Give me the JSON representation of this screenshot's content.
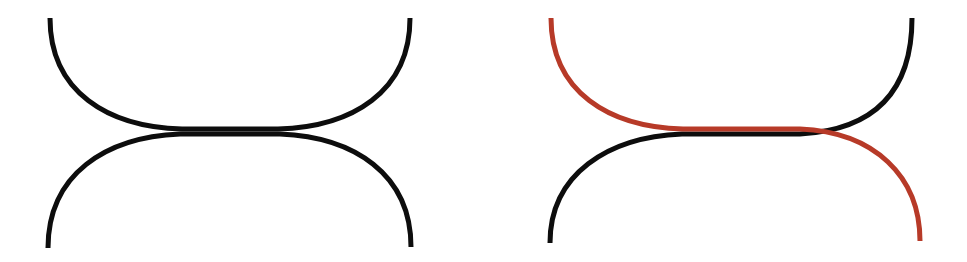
{
  "figure": {
    "kind": "line-diagram",
    "width": 967,
    "height": 262,
    "background_color": "#FFFFFF",
    "stroke_width": 5,
    "panel_count": 2,
    "caption": ""
  },
  "colors": {
    "black": "#0D0D0D",
    "red": "#B73A28",
    "background": "#FFFFFF"
  },
  "chart_data": {
    "type": "line",
    "subtitle": "",
    "xlabel": "",
    "ylabel": "",
    "xlim": [
      0,
      967
    ],
    "ylim": [
      0,
      262
    ],
    "grid": false,
    "legend": "none",
    "axis_visible": false,
    "tick_labels_x": [],
    "tick_labels_y": [],
    "annotations": [],
    "panels": [
      {
        "name": "left-panel",
        "label": "",
        "highlight": false,
        "origin_x": 0,
        "width": 460,
        "series": [
          {
            "name": "strand-a",
            "description": "arc from top-left down to waist then out to top-right",
            "color_key": "black",
            "color": "#0D0D0D",
            "path": "M 50 18 C 50 92, 108 127, 182 129 L 278 129 C 352 127, 410 92, 410 18"
          },
          {
            "name": "strand-b",
            "description": "arc from bottom-left up to waist then out to bottom-right",
            "color_key": "black",
            "color": "#0D0D0D",
            "path": "M 48 248 C 48 174, 106 137, 180 134 L 280 134 C 354 137, 411 174, 411 247"
          }
        ]
      },
      {
        "name": "right-panel",
        "label": "",
        "highlight": true,
        "origin_x": 484,
        "width": 483,
        "series": [
          {
            "name": "strand-a",
            "description": "red strand: enters top-left, passes through waist, exits bottom-right",
            "color_key": "red",
            "color": "#B73A28",
            "path": "M 551 18 C 551 92, 609 127, 683 129 L 800 129 C 874 132, 920 176, 920 241"
          },
          {
            "name": "strand-b",
            "description": "black strand: enters bottom-left, passes through waist, exits top-right",
            "color_key": "black",
            "color": "#0D0D0D",
            "path": "M 550 243 C 550 174, 608 137, 682 134 L 800 134 C 874 130, 912 92, 912 18"
          }
        ]
      }
    ]
  }
}
